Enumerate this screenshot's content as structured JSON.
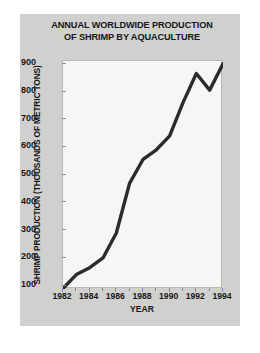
{
  "chart_data": {
    "type": "line",
    "title": "ANNUAL WORLDWIDE PRODUCTION OF SHRIMP BY AQUACULTURE",
    "title_lines": [
      "ANNUAL WORLDWIDE PRODUCTION",
      "OF SHRIMP BY AQUACULTURE"
    ],
    "xlabel": "YEAR",
    "ylabel": "SHRIMP PRODUCTION (THOUSANDS OF METRIC TONS)",
    "x": [
      1982,
      1983,
      1984,
      1985,
      1986,
      1987,
      1988,
      1989,
      1990,
      1991,
      1992,
      1993,
      1994
    ],
    "values": [
      90,
      140,
      165,
      200,
      290,
      470,
      555,
      590,
      640,
      760,
      865,
      805,
      900
    ],
    "series": [
      {
        "name": "Shrimp production",
        "values": [
          90,
          140,
          165,
          200,
          290,
          470,
          555,
          590,
          640,
          760,
          865,
          805,
          900
        ]
      }
    ],
    "xlim": [
      1982,
      1994
    ],
    "ylim": [
      88,
      910
    ],
    "xticks": [
      1982,
      1984,
      1986,
      1988,
      1990,
      1992,
      1994
    ],
    "xtick_labels": [
      "1982",
      "1984",
      "1986",
      "1988",
      "1990",
      "1992",
      "1994"
    ],
    "yticks": [
      100,
      200,
      300,
      400,
      500,
      600,
      700,
      800,
      900
    ],
    "ytick_labels": [
      "900",
      "800",
      "700",
      "600",
      "500",
      "400",
      "300",
      "200",
      "100"
    ],
    "grid": false,
    "legend": false,
    "line_color": "#2b2b2b",
    "plot_background": "#f6f6f4",
    "figure_background": "#d0d0ce",
    "text_color": "#17171a"
  }
}
